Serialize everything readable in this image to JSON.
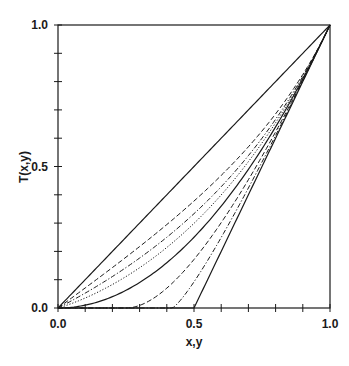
{
  "chart_data": {
    "type": "line",
    "title": "",
    "xlabel": "x,y",
    "ylabel": "T(x,y)",
    "xlim": [
      0,
      1
    ],
    "ylim": [
      0,
      1
    ],
    "grid": false,
    "legend": "none",
    "x_ticks": [
      0.0,
      0.1,
      0.2,
      0.3,
      0.4,
      0.5,
      0.6,
      0.7,
      0.8,
      0.9,
      1.0
    ],
    "y_ticks": [
      0.0,
      0.1,
      0.2,
      0.3,
      0.4,
      0.5,
      0.6,
      0.7,
      0.8,
      0.9,
      1.0
    ],
    "x_tick_labels": [
      "0.0",
      "0.5",
      "1.0"
    ],
    "y_tick_labels": [
      "0.0",
      "0.5",
      "1.0"
    ],
    "x": [
      0.0,
      0.1,
      0.2,
      0.3,
      0.4,
      0.5,
      0.6,
      0.7,
      0.8,
      0.9,
      1.0
    ],
    "series": [
      {
        "name": "curve-1",
        "style": "solid",
        "p": null,
        "values": [
          0.0,
          0.1,
          0.2,
          0.3,
          0.4,
          0.5,
          0.6,
          0.7,
          0.8,
          0.9,
          1.0
        ]
      },
      {
        "name": "curve-2",
        "style": "dashed",
        "p": -2,
        "values": [
          0.0,
          0.071,
          0.143,
          0.217,
          0.295,
          0.378,
          0.469,
          0.57,
          0.686,
          0.825,
          1.0
        ]
      },
      {
        "name": "curve-3",
        "style": "dashdot",
        "p": -1,
        "values": [
          0.0,
          0.053,
          0.111,
          0.176,
          0.25,
          0.333,
          0.429,
          0.538,
          0.667,
          0.818,
          1.0
        ]
      },
      {
        "name": "curve-4",
        "style": "dotted",
        "p": -0.5,
        "values": [
          0.0,
          0.035,
          0.083,
          0.142,
          0.214,
          0.299,
          0.4,
          0.518,
          0.655,
          0.815,
          1.0
        ]
      },
      {
        "name": "curve-5",
        "style": "solid",
        "p": 0,
        "values": [
          0.0,
          0.01,
          0.04,
          0.09,
          0.16,
          0.25,
          0.36,
          0.49,
          0.64,
          0.81,
          1.0
        ]
      },
      {
        "name": "curve-6",
        "style": "dashed",
        "p": 0.5,
        "values": [
          0.0,
          0.0,
          0.0,
          0.009,
          0.07,
          0.172,
          0.302,
          0.453,
          0.622,
          0.805,
          1.0
        ]
      },
      {
        "name": "curve-7",
        "style": "dashdot",
        "p": 0.8,
        "values": [
          0.0,
          0.0,
          0.0,
          0.0,
          0.0,
          0.092,
          0.249,
          0.424,
          0.609,
          0.802,
          1.0
        ]
      },
      {
        "name": "curve-8",
        "style": "solid",
        "p": 1,
        "values": [
          0.0,
          0.0,
          0.0,
          0.0,
          0.0,
          0.0,
          0.2,
          0.4,
          0.6,
          0.8,
          1.0
        ]
      }
    ]
  },
  "axes": {
    "x_label": "x,y",
    "y_label": "T(x,y)",
    "x_tick_0": "0.0",
    "x_tick_mid": "0.5",
    "x_tick_1": "1.0",
    "y_tick_0": "0.0",
    "y_tick_mid": "0.5",
    "y_tick_1": "1.0"
  },
  "colors": {
    "line": "#1a1a1a",
    "background": "#ffffff"
  }
}
